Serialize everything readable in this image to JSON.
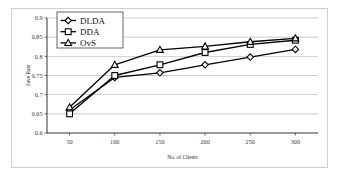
{
  "chart_data": {
    "type": "line",
    "title": "",
    "xlabel": "No. of Clients",
    "ylabel": "Save Rate",
    "categories": [
      50,
      100,
      150,
      200,
      250,
      300
    ],
    "x": [
      50,
      100,
      150,
      200,
      250,
      300
    ],
    "xlim": [
      25,
      325
    ],
    "ylim": [
      0.6,
      0.9
    ],
    "xticks": [
      "50",
      "100",
      "150",
      "200",
      "250",
      "300"
    ],
    "yticks": [
      "0.6",
      "0.65",
      "0.7",
      "0.75",
      "0.8",
      "0.85",
      "0.9"
    ],
    "ytick_values": [
      0.6,
      0.65,
      0.7,
      0.75,
      0.8,
      0.85,
      0.9
    ],
    "grid": "horizontal",
    "legend_position": "top-left-inside",
    "series": [
      {
        "name": "DLDA",
        "marker": "diamond",
        "color": "#000000",
        "values": [
          0.66,
          0.745,
          0.757,
          0.778,
          0.798,
          0.818
        ]
      },
      {
        "name": "DDA",
        "marker": "square",
        "color": "#000000",
        "values": [
          0.65,
          0.75,
          0.778,
          0.81,
          0.831,
          0.842
        ]
      },
      {
        "name": "OvS",
        "marker": "triangle",
        "color": "#000000",
        "values": [
          0.667,
          0.778,
          0.817,
          0.826,
          0.838,
          0.847
        ]
      }
    ]
  },
  "legend": {
    "entries": [
      {
        "label": "DLDA",
        "marker": "diamond-marker-icon"
      },
      {
        "label": "DDA",
        "marker": "square-marker-icon"
      },
      {
        "label": "OvS",
        "marker": "triangle-marker-icon"
      }
    ]
  },
  "axes": {
    "y_title": "Save Rate",
    "x_title": "No. of Clients"
  },
  "colors": {
    "line": "#000000",
    "grid": "#9a9a9a",
    "axis": "#4a4a4a",
    "frame": "#cfcfcf",
    "background": "#ffffff"
  }
}
